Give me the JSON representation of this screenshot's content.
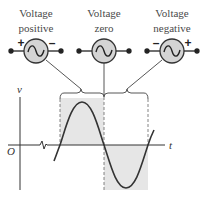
{
  "sources": [
    {
      "id": "positive",
      "label_line1": "Voltage",
      "label_line2": "positive",
      "left_sign": "+",
      "right_sign": "–",
      "symbol": "∿"
    },
    {
      "id": "zero",
      "label_line1": "Voltage",
      "label_line2": "zero",
      "left_sign": "",
      "right_sign": "",
      "symbol": "∿"
    },
    {
      "id": "negative",
      "label_line1": "Voltage",
      "label_line2": "negative",
      "left_sign": "–",
      "right_sign": "+",
      "symbol": "∿"
    }
  ],
  "graph": {
    "y_axis_label": "v",
    "x_axis_label": "t",
    "origin_label": "O",
    "shaded_regions": [
      {
        "meaning": "voltage positive half-cycle",
        "position": "above axis"
      },
      {
        "meaning": "voltage negative half-cycle",
        "position": "below axis"
      }
    ]
  },
  "colors": {
    "source_fill": "#d4d4d4",
    "shade": "#e6e6e6",
    "line": "#333333"
  }
}
